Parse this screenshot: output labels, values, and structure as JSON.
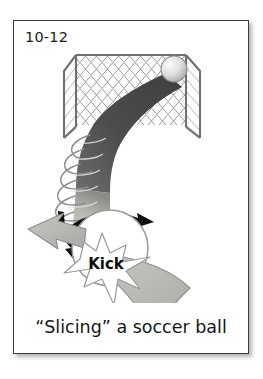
{
  "figure": {
    "number_label": "10-12",
    "caption": "“Slicing” a soccer ball",
    "border_color": "#3b3b3b",
    "background_color": "#ffffff"
  },
  "illustration": {
    "title": "soccer-ball-slice-diagram",
    "labels": {
      "kick": "Kick"
    },
    "colors": {
      "arrow_fill": "#b9bab6",
      "arrow_stroke": "#8d8e8a",
      "trajectory_dark": "#4a4a4a",
      "trajectory_light": "#c9cac6",
      "net_line": "#8f9094",
      "goal_post": "#6f7074",
      "ball_light": "#e8e8e6",
      "ball_shade": "#b2b3b0",
      "spin_arrow": "#101010",
      "star_fill": "#ffffff",
      "star_stroke": "#9a9b97",
      "kick_text": "#0d0d0d"
    },
    "elements": [
      {
        "name": "goal-frame",
        "kind": "goal"
      },
      {
        "name": "goal-net",
        "kind": "net"
      },
      {
        "name": "soccer-ball-in-goal",
        "kind": "ball"
      },
      {
        "name": "trajectory-band",
        "kind": "curve"
      },
      {
        "name": "spin-helix",
        "kind": "helix"
      },
      {
        "name": "spin-arrow-top",
        "kind": "arrow"
      },
      {
        "name": "spin-arrow-left",
        "kind": "arrow"
      },
      {
        "name": "soccer-ball-kicked",
        "kind": "ball"
      },
      {
        "name": "force-arrow-left",
        "kind": "arrow"
      },
      {
        "name": "follow-through-swoosh",
        "kind": "arrow"
      },
      {
        "name": "kick-starburst",
        "kind": "star"
      }
    ]
  }
}
